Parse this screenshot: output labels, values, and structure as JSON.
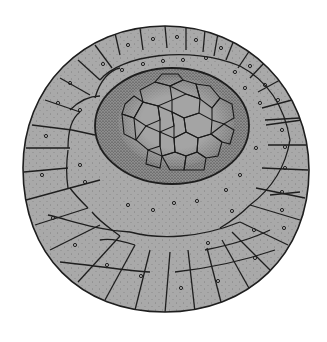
{
  "figure": {
    "colors": {
      "background": "#ffffff",
      "cell_fill": "#a9a9a9",
      "inner_cell_fill": "#a4a4a4",
      "outline": "#1e1e1e",
      "stipple_dark": "#3a3a3a"
    },
    "outer_disc": {
      "cx": 165,
      "cy": 168,
      "rx": 143,
      "ry": 143
    },
    "inner_region": {
      "cx": 172,
      "cy": 126,
      "rx": 77,
      "ry": 58
    }
  }
}
